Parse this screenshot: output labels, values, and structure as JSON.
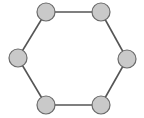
{
  "diagram": {
    "type": "graph",
    "colors": {
      "node_fill": "#c9c9c9",
      "node_stroke": "#6a6a6a",
      "edge": "#555555",
      "background": "#ffffff"
    },
    "node_radius": 9,
    "nodes": [
      {
        "id": "n1",
        "x": 46,
        "y": 12
      },
      {
        "id": "n2",
        "x": 101,
        "y": 12
      },
      {
        "id": "n3",
        "x": 127,
        "y": 59
      },
      {
        "id": "n4",
        "x": 101,
        "y": 105
      },
      {
        "id": "n5",
        "x": 46,
        "y": 105
      },
      {
        "id": "n6",
        "x": 18,
        "y": 58
      }
    ],
    "edges": [
      [
        "n1",
        "n2"
      ],
      [
        "n2",
        "n3"
      ],
      [
        "n3",
        "n4"
      ],
      [
        "n4",
        "n5"
      ],
      [
        "n5",
        "n6"
      ],
      [
        "n6",
        "n1"
      ]
    ]
  }
}
